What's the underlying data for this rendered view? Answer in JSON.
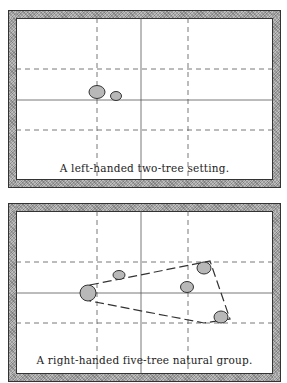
{
  "figures": [
    {
      "caption": "A left-handed two-tree setting.",
      "grid": {
        "dashed_verticals": [
          81,
          172
        ],
        "solid_vertical": 125,
        "dashed_horizontals": [
          51,
          112
        ],
        "solid_horizontal": 82
      },
      "trees": [
        {
          "cx": 81,
          "cy": 74,
          "rx": 8,
          "ry": 6.5
        },
        {
          "cx": 100,
          "cy": 78,
          "rx": 5.5,
          "ry": 4.5
        }
      ],
      "group_outline": []
    },
    {
      "caption": "A right-handed five-tree natural group.",
      "grid": {
        "dashed_verticals": [
          81,
          172
        ],
        "solid_vertical": 125,
        "dashed_horizontals": [
          51,
          112
        ],
        "solid_horizontal": 82
      },
      "trees": [
        {
          "cx": 72,
          "cy": 82,
          "rx": 8,
          "ry": 8
        },
        {
          "cx": 103,
          "cy": 64,
          "rx": 6,
          "ry": 4.5
        },
        {
          "cx": 171,
          "cy": 76,
          "rx": 6.5,
          "ry": 5.5
        },
        {
          "cx": 188,
          "cy": 57,
          "rx": 7,
          "ry": 6
        },
        {
          "cx": 205,
          "cy": 106,
          "rx": 7,
          "ry": 6
        }
      ],
      "group_outline": [
        [
          74,
          74
        ],
        [
          194,
          50
        ],
        [
          214,
          108
        ],
        [
          188,
          112
        ],
        [
          74,
          90
        ]
      ]
    }
  ],
  "colors": {
    "tree_fill": "#b8b8b8",
    "tree_stroke": "#333333",
    "grid": "#555555"
  }
}
